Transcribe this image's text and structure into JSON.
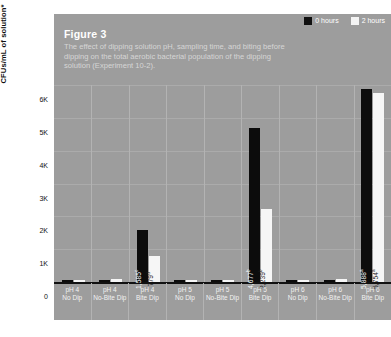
{
  "figure": {
    "number_label": "Figure 3",
    "description": "The effect of dipping solution pH, sampling time, and biting before dipping on the total aerobic bacterial population of the dipping solution (Experiment 10-2).",
    "footnote": ""
  },
  "legend": {
    "items": [
      {
        "label": "0 hours",
        "color": "#0c0c0c",
        "swatch": "black"
      },
      {
        "label": "2 hours",
        "color": "#f6f6f6",
        "swatch": "white"
      }
    ]
  },
  "colors": {
    "panel_background": "#9d9d9d",
    "series_0_hours": "#0c0c0c",
    "series_2_hours": "#f6f6f6",
    "gridline": "#b0b0b0",
    "axis": "#111111",
    "title_text": "#ffffff",
    "description_text": "#d6d6d6"
  },
  "chart_data": {
    "type": "bar",
    "title": "Figure 3",
    "subtitle": "The effect of dipping solution pH, sampling time, and biting before dipping on the total aerobic bacterial population of the dipping solution (Experiment 10-2).",
    "xlabel": "",
    "ylabel": "CFUs/mL of solution*",
    "ylim": [
      0,
      6000
    ],
    "yticks": [
      0,
      1000,
      2000,
      3000,
      4000,
      5000,
      6000
    ],
    "ytick_labels": [
      "0",
      "1K",
      "2K",
      "3K",
      "4K",
      "5K",
      "6K"
    ],
    "grid": true,
    "legend_position": "top-right",
    "categories": [
      "pH 4 No Dip",
      "pH 4 No-Bite Dip",
      "pH 4 Bite Dip",
      "pH 5 No Dip",
      "pH 5 No-Bite Dip",
      "pH 5 Bite Dip",
      "pH 6 No Dip",
      "pH 6 No-Bite Dip",
      "pH 6 Bite Dip"
    ],
    "series": [
      {
        "name": "0 hours",
        "color": "#0c0c0c",
        "values": [
          60,
          70,
          1585,
          55,
          60,
          4677,
          55,
          60,
          5888
        ],
        "labels": [
          "",
          "",
          "1,585",
          "",
          "",
          "4,677",
          "",
          "",
          "5,888"
        ],
        "label_markers": [
          "",
          "",
          "c",
          "",
          "",
          "b",
          "",
          "",
          "a"
        ]
      },
      {
        "name": "2 hours",
        "color": "#f6f6f6",
        "values": [
          70,
          80,
          779,
          65,
          70,
          2239,
          65,
          80,
          5754
        ],
        "labels": [
          "",
          "",
          "779",
          "",
          "",
          "2,239",
          "",
          "",
          "5,754"
        ],
        "label_markers": [
          "",
          "",
          "d",
          "",
          "",
          "b",
          "",
          "",
          "a"
        ]
      }
    ]
  }
}
